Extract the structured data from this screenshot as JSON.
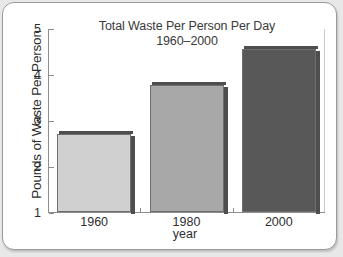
{
  "chart_data": {
    "type": "bar",
    "title": "Total Waste Per Person Per Day",
    "subtitle": "1960–2000",
    "xlabel": "year",
    "ylabel": "Pounds of Waste Per Person",
    "categories": [
      "1960",
      "1980",
      "2000"
    ],
    "values": [
      2.7,
      3.77,
      4.55
    ],
    "ylim": [
      1,
      5
    ],
    "yticks": [
      1,
      2,
      3,
      4,
      5
    ],
    "ytick_labels": [
      "1",
      "2",
      "3",
      "4",
      "5"
    ],
    "grid": false,
    "legend": "none",
    "bar_colors": [
      "#d0d0d0",
      "#a8a8a8",
      "#585858"
    ],
    "bar_edge_color": "#6e6e6e",
    "bar_shadow_color": "#4e4e4e",
    "axis_color": "#8d8d8d",
    "text_color": "#2e2e2e",
    "background": "#ffffff",
    "page_background": "#e8e8e8",
    "series": [
      {
        "name": "Total Waste Per Person Per Day",
        "values": [
          2.7,
          3.77,
          4.55
        ]
      }
    ]
  }
}
